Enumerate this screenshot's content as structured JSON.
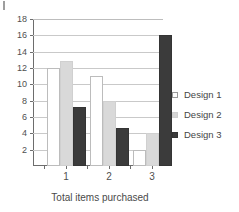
{
  "chart_data": {
    "type": "bar",
    "title": "",
    "xlabel": "Total items purchased",
    "ylabel": "",
    "categories": [
      "1",
      "2",
      "3"
    ],
    "yticks": [
      2,
      4,
      6,
      8,
      10,
      12,
      14,
      16,
      18
    ],
    "ylim": [
      0,
      18
    ],
    "grid": true,
    "legend_position": "right",
    "series": [
      {
        "name": "Design 1",
        "color": "#ffffff",
        "values": [
          12,
          11,
          2
        ]
      },
      {
        "name": "Design 2",
        "color": "#d9d9d9",
        "values": [
          12.8,
          8,
          4
        ]
      },
      {
        "name": "Design 3",
        "color": "#3b3b3b",
        "values": [
          7.2,
          4.6,
          16
        ]
      }
    ]
  },
  "legend": {
    "items": [
      {
        "label": "Design 1"
      },
      {
        "label": "Design 2"
      },
      {
        "label": "Design 3"
      }
    ]
  },
  "axis": {
    "x_title": "Total items purchased",
    "x_tick_labels": [
      "1",
      "2",
      "3"
    ],
    "y_tick_labels": [
      "2",
      "4",
      "6",
      "8",
      "10",
      "12",
      "14",
      "16",
      "18"
    ]
  }
}
